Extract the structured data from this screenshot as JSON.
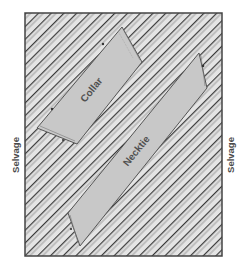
{
  "diagram": {
    "type": "fabric-layout",
    "fabric": {
      "stripe_direction": "diagonal-45",
      "fill_color": "#e4e4e4",
      "stripe_color": "#3a3a3a",
      "border_color": "#444444"
    },
    "selvage_left_label": "Selvage",
    "selvage_right_label": "Selvage",
    "pieces": [
      {
        "id": "collar",
        "label": "Collar",
        "fill_color": "#c8c8c8"
      },
      {
        "id": "necktie",
        "label": "Necktie",
        "fill_color": "#c8c8c8"
      }
    ]
  }
}
